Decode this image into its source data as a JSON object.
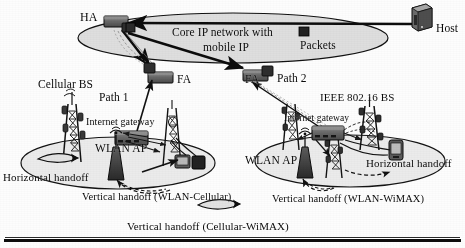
{
  "figure": {
    "ink_color": "#111111",
    "cloud_fill": "#d9d9d9",
    "cell_fill": "#ececec",
    "node_fill": "#6f6f6f",
    "node_dark": "#2b2b2b"
  },
  "core": {
    "label_line1": "Core IP network with",
    "label_line2": "mobile IP",
    "ha_label": "HA",
    "fa_left_label": "FA",
    "fa_right_label": "FA",
    "host_label": "Host",
    "packets_label": "Packets"
  },
  "paths": {
    "path1_label": "Path 1",
    "path2_label": "Path 2"
  },
  "left_cell": {
    "bs_label": "Cellular BS",
    "gateway_label": "Internet gateway",
    "ap_label": "WLAN AP",
    "horizontal_handoff_label": "Horizontal handoff",
    "vertical_handoff_label": "Vertical handoff (WLAN-Cellular)"
  },
  "right_cell": {
    "bs_label": "IEEE 802.16 BS",
    "gateway_label": "Internet gateway",
    "ap_label": "WLAN AP",
    "horizontal_handoff_label": "Horizontal handoff",
    "vertical_handoff_label": "Vertical handoff (WLAN-WiMAX)"
  },
  "cross_cell": {
    "vertical_handoff_label": "Vertical handoff (Cellular-WiMAX)"
  }
}
